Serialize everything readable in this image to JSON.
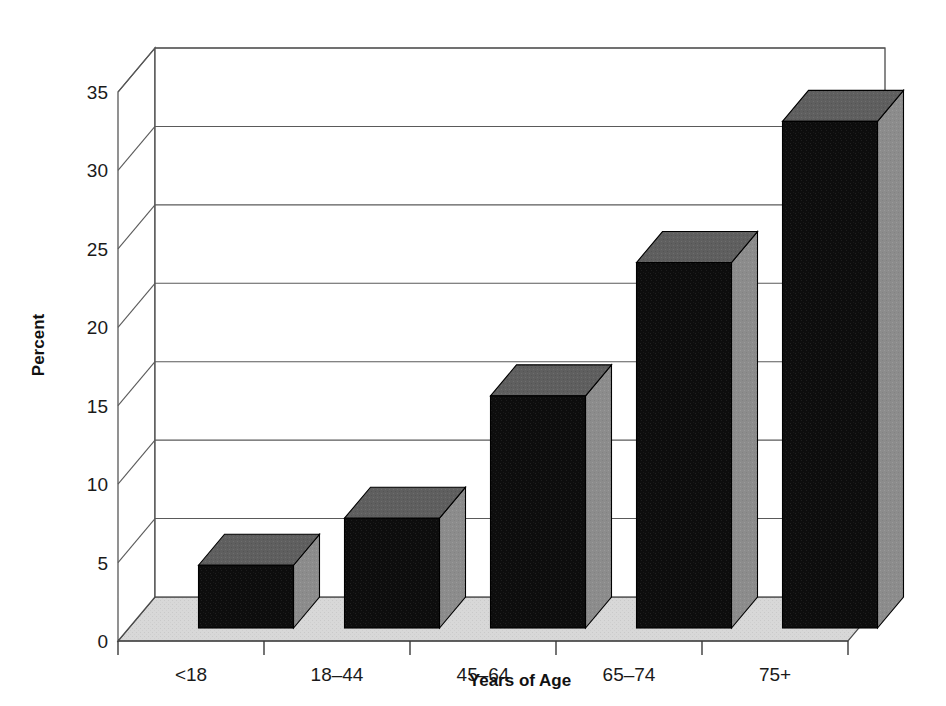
{
  "chart_data": {
    "type": "bar",
    "title": "",
    "subtitle": "",
    "xlabel": "Years of Age",
    "ylabel": "Percent",
    "categories": [
      "<18",
      "18–44",
      "45–64",
      "65–74",
      "75+"
    ],
    "values": [
      4.0,
      7.0,
      14.8,
      23.3,
      32.3
    ],
    "series": [
      {
        "name": "Percent",
        "values": [
          4.0,
          7.0,
          14.8,
          23.3,
          32.3
        ]
      }
    ],
    "ylim": [
      0,
      35
    ],
    "ytick_labels": [
      "0",
      "5",
      "10",
      "15",
      "20",
      "25",
      "30",
      "35"
    ],
    "ytick_values": [
      0,
      5,
      10,
      15,
      20,
      25,
      30,
      35
    ],
    "grid": true,
    "grid_axis": "y",
    "legend": false,
    "legend_position": "none",
    "style": "3d-bar",
    "annotations": []
  },
  "colors": {
    "bar_front": "#101010",
    "bar_top": "#5f5f5f",
    "bar_side": "#8c8c8c",
    "bar_edge": "#000000",
    "floor": "#d6d6d6",
    "wall": "#ffffff",
    "grid": "#5a5a5a",
    "frame": "#4a4a4a",
    "text": "#1a1a1a",
    "background": "#ffffff"
  },
  "axis": {
    "y_title": "Percent",
    "x_title": "Years of Age"
  }
}
